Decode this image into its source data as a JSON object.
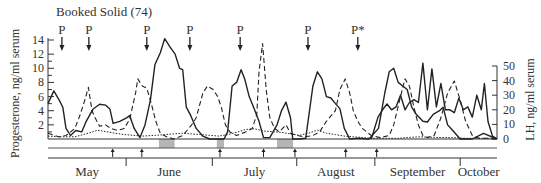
{
  "chart_data": {
    "type": "line",
    "title": "Booked Solid (74)",
    "xlabel": "",
    "ylabel": "Progesterone, ng/ml serum",
    "ylabel_right": "LH, ng/ml serum",
    "ylim": [
      0,
      14
    ],
    "ylim_right": [
      0,
      50
    ],
    "left_ticks": [
      "2",
      "4",
      "6",
      "8",
      "10",
      "12",
      "14"
    ],
    "right_ticks": [
      "0",
      "10",
      "20",
      "30",
      "40",
      "50"
    ],
    "months": [
      "May",
      "June",
      "July",
      "August",
      "September",
      "October"
    ],
    "p_markers": [
      {
        "label": "P",
        "x_frac": 0.031
      },
      {
        "label": "P",
        "x_frac": 0.091
      },
      {
        "label": "P",
        "x_frac": 0.22
      },
      {
        "label": "P",
        "x_frac": 0.316
      },
      {
        "label": "P",
        "x_frac": 0.428
      },
      {
        "label": "P",
        "x_frac": 0.579
      },
      {
        "label": "P*",
        "x_frac": 0.69
      }
    ],
    "shaded_periods_x_frac": [
      [
        0.247,
        0.282
      ],
      [
        0.376,
        0.392
      ],
      [
        0.51,
        0.546
      ]
    ],
    "event_arrows_x_frac": [
      0.144,
      0.209,
      0.383,
      0.48,
      0.55,
      0.663,
      0.732
    ],
    "grid": false,
    "legend": "none",
    "series": [
      {
        "name": "Progesterone",
        "style": "solid",
        "axis": "left",
        "points": [
          [
            0.0,
            5.0
          ],
          [
            0.013,
            6.8
          ],
          [
            0.025,
            5.5
          ],
          [
            0.033,
            4.5
          ],
          [
            0.04,
            1.5
          ],
          [
            0.05,
            0.5
          ],
          [
            0.062,
            1.2
          ],
          [
            0.075,
            1.0
          ],
          [
            0.085,
            2.5
          ],
          [
            0.1,
            4.2
          ],
          [
            0.115,
            4.9
          ],
          [
            0.128,
            4.8
          ],
          [
            0.138,
            4.2
          ],
          [
            0.145,
            2.2
          ],
          [
            0.16,
            2.5
          ],
          [
            0.175,
            3.0
          ],
          [
            0.182,
            3.3
          ],
          [
            0.192,
            1.5
          ],
          [
            0.205,
            0.2
          ],
          [
            0.216,
            2.0
          ],
          [
            0.228,
            5.5
          ],
          [
            0.238,
            10.5
          ],
          [
            0.25,
            12.2
          ],
          [
            0.26,
            14.2
          ],
          [
            0.272,
            13.0
          ],
          [
            0.283,
            12.0
          ],
          [
            0.293,
            10.0
          ],
          [
            0.3,
            9.8
          ],
          [
            0.308,
            4.5
          ],
          [
            0.318,
            3.3
          ],
          [
            0.33,
            1.5
          ],
          [
            0.345,
            0.4
          ],
          [
            0.36,
            0.0
          ],
          [
            0.392,
            0.0
          ],
          [
            0.4,
            1.0
          ],
          [
            0.41,
            7.5
          ],
          [
            0.42,
            8.0
          ],
          [
            0.43,
            9.8
          ],
          [
            0.438,
            8.5
          ],
          [
            0.448,
            6.0
          ],
          [
            0.458,
            4.5
          ],
          [
            0.47,
            2.5
          ],
          [
            0.48,
            0.2
          ],
          [
            0.494,
            0.2
          ],
          [
            0.51,
            2.0
          ],
          [
            0.52,
            4.0
          ],
          [
            0.53,
            5.2
          ],
          [
            0.54,
            3.0
          ],
          [
            0.545,
            0.0
          ],
          [
            0.56,
            0.0
          ],
          [
            0.574,
            0.1
          ],
          [
            0.59,
            7.5
          ],
          [
            0.6,
            9.5
          ],
          [
            0.61,
            8.5
          ],
          [
            0.62,
            6.0
          ],
          [
            0.63,
            5.8
          ],
          [
            0.64,
            5.0
          ],
          [
            0.65,
            4.3
          ],
          [
            0.66,
            1.5
          ],
          [
            0.672,
            0.0
          ],
          [
            0.69,
            0.1
          ],
          [
            0.715,
            0.0
          ],
          [
            0.736,
            1.5
          ],
          [
            0.75,
            6.5
          ],
          [
            0.76,
            9.5
          ],
          [
            0.77,
            10.0
          ],
          [
            0.78,
            8.0
          ],
          [
            0.79,
            7.5
          ],
          [
            0.8,
            7.0
          ],
          [
            0.81,
            4.5
          ],
          [
            0.82,
            3.5
          ],
          [
            0.835,
            2.5
          ],
          [
            0.845,
            2.4
          ],
          [
            0.858,
            3.5
          ],
          [
            0.872,
            4.0
          ],
          [
            0.88,
            4.5
          ],
          [
            0.89,
            2.0
          ],
          [
            0.9,
            1.3
          ],
          [
            0.918,
            0.0
          ],
          [
            0.945,
            0.0
          ],
          [
            0.97,
            0.8
          ],
          [
            1.0,
            0.0
          ]
        ]
      },
      {
        "name": "Progesterone (dashed)",
        "style": "dashed",
        "axis": "left",
        "points": [
          [
            0.0,
            0.8
          ],
          [
            0.025,
            0.3
          ],
          [
            0.04,
            0.5
          ],
          [
            0.06,
            1.5
          ],
          [
            0.072,
            3.5
          ],
          [
            0.082,
            5.5
          ],
          [
            0.09,
            7.3
          ],
          [
            0.098,
            4.0
          ],
          [
            0.105,
            3.0
          ],
          [
            0.115,
            1.8
          ],
          [
            0.128,
            2.0
          ],
          [
            0.14,
            1.5
          ],
          [
            0.155,
            1.2
          ],
          [
            0.17,
            1.5
          ],
          [
            0.182,
            2.8
          ],
          [
            0.195,
            6.5
          ],
          [
            0.2,
            8.5
          ],
          [
            0.21,
            7.5
          ],
          [
            0.22,
            7.2
          ],
          [
            0.23,
            5.0
          ],
          [
            0.24,
            2.5
          ],
          [
            0.25,
            0.8
          ],
          [
            0.265,
            0.3
          ],
          [
            0.28,
            0.0
          ],
          [
            0.3,
            0.5
          ],
          [
            0.32,
            2.0
          ],
          [
            0.33,
            3.0
          ],
          [
            0.345,
            6.5
          ],
          [
            0.355,
            7.5
          ],
          [
            0.368,
            7.0
          ],
          [
            0.378,
            6.0
          ],
          [
            0.386,
            4.5
          ],
          [
            0.395,
            2.0
          ],
          [
            0.405,
            1.0
          ],
          [
            0.42,
            0.5
          ],
          [
            0.44,
            1.0
          ],
          [
            0.455,
            1.5
          ],
          [
            0.465,
            3.5
          ],
          [
            0.47,
            9.5
          ],
          [
            0.478,
            13.5
          ],
          [
            0.486,
            7.0
          ],
          [
            0.494,
            3.0
          ],
          [
            0.505,
            1.5
          ],
          [
            0.515,
            1.0
          ],
          [
            0.53,
            2.0
          ],
          [
            0.54,
            0.8
          ],
          [
            0.555,
            0.5
          ],
          [
            0.57,
            0.3
          ],
          [
            0.59,
            0.5
          ],
          [
            0.605,
            1.0
          ],
          [
            0.62,
            2.5
          ],
          [
            0.64,
            4.0
          ],
          [
            0.65,
            7.0
          ],
          [
            0.662,
            8.5
          ],
          [
            0.672,
            6.5
          ],
          [
            0.68,
            4.0
          ],
          [
            0.69,
            2.5
          ],
          [
            0.7,
            1.5
          ],
          [
            0.71,
            1.0
          ],
          [
            0.72,
            0.5
          ],
          [
            0.74,
            0.2
          ],
          [
            0.76,
            0.5
          ],
          [
            0.77,
            2.0
          ],
          [
            0.785,
            6.0
          ],
          [
            0.795,
            8.5
          ],
          [
            0.805,
            7.5
          ],
          [
            0.815,
            4.5
          ],
          [
            0.825,
            2.0
          ],
          [
            0.835,
            0.5
          ],
          [
            0.845,
            0.2
          ],
          [
            0.86,
            0.5
          ],
          [
            0.875,
            3.0
          ],
          [
            0.89,
            6.5
          ],
          [
            0.905,
            8.2
          ],
          [
            0.918,
            5.5
          ],
          [
            0.93,
            2.5
          ],
          [
            0.945,
            0.5
          ],
          [
            0.96,
            0.1
          ],
          [
            0.98,
            0.1
          ],
          [
            1.0,
            0.0
          ]
        ]
      },
      {
        "name": "LH",
        "style": "dotted",
        "axis": "right",
        "points": [
          [
            0.0,
            2.0
          ],
          [
            0.03,
            1.5
          ],
          [
            0.06,
            1.5
          ],
          [
            0.09,
            4.0
          ],
          [
            0.11,
            6.0
          ],
          [
            0.13,
            5.0
          ],
          [
            0.15,
            4.0
          ],
          [
            0.17,
            3.0
          ],
          [
            0.19,
            2.5
          ],
          [
            0.21,
            2.0
          ],
          [
            0.24,
            2.5
          ],
          [
            0.26,
            3.0
          ],
          [
            0.28,
            3.5
          ],
          [
            0.3,
            4.0
          ],
          [
            0.32,
            3.5
          ],
          [
            0.34,
            3.0
          ],
          [
            0.36,
            2.5
          ],
          [
            0.38,
            2.0
          ],
          [
            0.4,
            3.0
          ],
          [
            0.42,
            4.5
          ],
          [
            0.44,
            6.5
          ],
          [
            0.46,
            7.0
          ],
          [
            0.48,
            5.5
          ],
          [
            0.5,
            5.0
          ],
          [
            0.52,
            4.5
          ],
          [
            0.54,
            3.5
          ],
          [
            0.56,
            2.5
          ],
          [
            0.58,
            4.0
          ],
          [
            0.6,
            6.0
          ],
          [
            0.62,
            4.0
          ],
          [
            0.64,
            3.0
          ],
          [
            0.66,
            2.0
          ],
          [
            0.68,
            1.5
          ],
          [
            0.7,
            1.0
          ],
          [
            0.72,
            0.5
          ],
          [
            0.74,
            0.5
          ],
          [
            0.76,
            0.5
          ],
          [
            0.78,
            0.5
          ],
          [
            0.8,
            1.0
          ],
          [
            0.83,
            1.5
          ],
          [
            0.85,
            1.2
          ],
          [
            0.87,
            1.0
          ],
          [
            0.89,
            1.0
          ],
          [
            0.91,
            0.8
          ],
          [
            0.93,
            0.5
          ],
          [
            0.95,
            0.5
          ],
          [
            1.0,
            0.5
          ]
        ]
      },
      {
        "name": "LH (surge)",
        "style": "solid",
        "axis": "right",
        "points": [
          [
            0.72,
            0.0
          ],
          [
            0.735,
            15.0
          ],
          [
            0.745,
            20.0
          ],
          [
            0.755,
            24.0
          ],
          [
            0.765,
            20.0
          ],
          [
            0.775,
            22.0
          ],
          [
            0.785,
            30.0
          ],
          [
            0.795,
            20.0
          ],
          [
            0.805,
            25.0
          ],
          [
            0.815,
            27.0
          ],
          [
            0.825,
            25.0
          ],
          [
            0.835,
            52.0
          ],
          [
            0.845,
            20.0
          ],
          [
            0.855,
            48.0
          ],
          [
            0.865,
            22.0
          ],
          [
            0.875,
            38.0
          ],
          [
            0.885,
            20.0
          ],
          [
            0.895,
            20.0
          ],
          [
            0.905,
            18.0
          ],
          [
            0.915,
            28.0
          ],
          [
            0.925,
            20.0
          ],
          [
            0.935,
            22.0
          ],
          [
            0.945,
            15.0
          ],
          [
            0.955,
            30.0
          ],
          [
            0.965,
            20.0
          ],
          [
            0.972,
            38.0
          ],
          [
            0.98,
            12.0
          ],
          [
            0.99,
            2.0
          ],
          [
            1.0,
            0.0
          ]
        ]
      }
    ]
  },
  "header": {
    "title": "Booked Solid (74)"
  },
  "axes": {
    "left_label": "Progesterone, ng/ml serum",
    "right_label": "LH, ng/ml serum"
  }
}
